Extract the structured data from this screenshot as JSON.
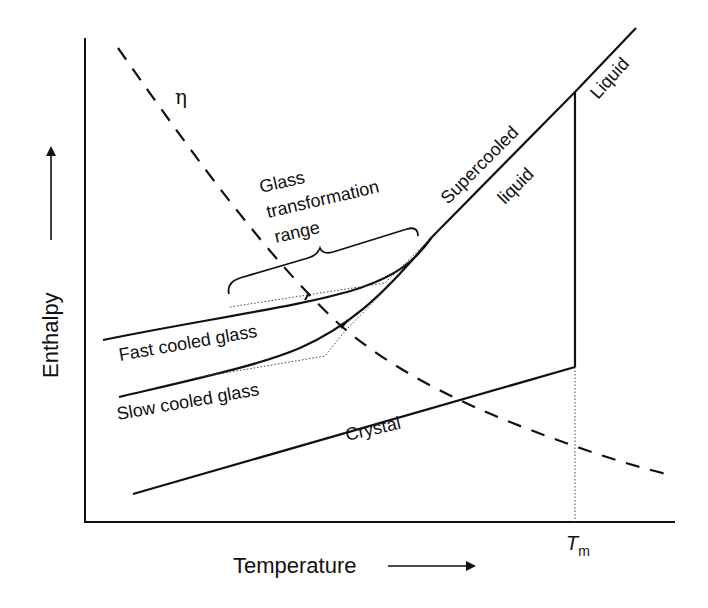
{
  "diagram": {
    "title": "",
    "x_axis": {
      "label": "Temperature",
      "arrow": "right-arrow"
    },
    "y_axis": {
      "label": "Enthalpy",
      "arrow": "up-arrow"
    },
    "tick_label": {
      "symbol": "T",
      "subscript": "m"
    },
    "viscosity_symbol": "η",
    "labels": {
      "liquid": "Liquid",
      "supercooled_1": "Supercooled",
      "supercooled_2": "liquid",
      "glass_range_1": "Glass",
      "glass_range_2": "transformation",
      "glass_range_3": "range",
      "fast_glass": "Fast cooled glass",
      "slow_glass": "Slow cooled glass",
      "crystal": "Crystal"
    },
    "colors": {
      "line": "#111111",
      "background": "#ffffff"
    }
  }
}
